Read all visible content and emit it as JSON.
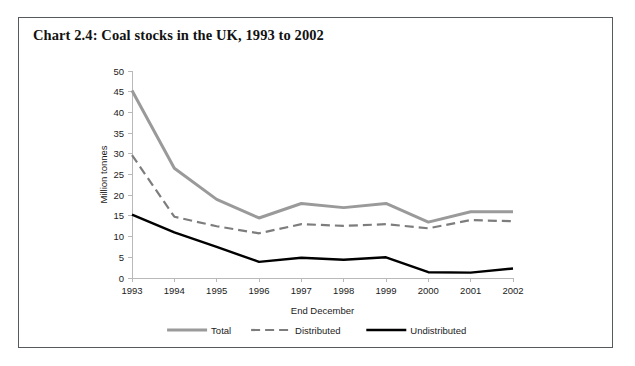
{
  "figure": {
    "title": "Chart 2.4: Coal stocks in the UK, 1993 to 2002",
    "border_color": "#555a5f",
    "background": "#ffffff"
  },
  "chart_data": {
    "type": "line",
    "title": "Chart 2.4: Coal stocks in the UK, 1993 to 2002",
    "xlabel": "End December",
    "ylabel": "Million tonnes",
    "categories": [
      "1993",
      "1994",
      "1995",
      "1996",
      "1997",
      "1998",
      "1999",
      "2000",
      "2001",
      "2002"
    ],
    "x": [
      1993,
      1994,
      1995,
      1996,
      1997,
      1998,
      1999,
      2000,
      2001,
      2002
    ],
    "ylim": [
      0,
      50
    ],
    "yticks": [
      0,
      5,
      10,
      15,
      20,
      25,
      30,
      35,
      40,
      45,
      50
    ],
    "ytick_labels": [
      "0",
      "5",
      "10",
      "15",
      "20",
      "25",
      "30",
      "35",
      "40",
      "45",
      "50"
    ],
    "grid": false,
    "legend_position": "bottom",
    "series": [
      {
        "name": "Total",
        "color": "#9a9a9a",
        "style": "solid",
        "width": 3,
        "values": [
          45.3,
          26.5,
          19.0,
          14.5,
          18.0,
          17.0,
          18.0,
          13.5,
          16.0,
          16.0
        ]
      },
      {
        "name": "Distributed",
        "color": "#7d7d7d",
        "style": "dashed",
        "width": 2.2,
        "values": [
          29.7,
          14.8,
          12.5,
          10.8,
          13.0,
          12.6,
          13.0,
          12.0,
          14.0,
          13.7
        ]
      },
      {
        "name": "Undistributed",
        "color": "#000000",
        "style": "solid",
        "width": 2.4,
        "values": [
          15.3,
          11.0,
          7.5,
          3.9,
          4.9,
          4.4,
          5.0,
          1.4,
          1.3,
          2.3
        ]
      }
    ]
  }
}
